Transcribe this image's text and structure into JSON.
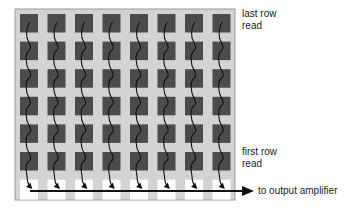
{
  "diagram": {
    "grid": {
      "columns": 8,
      "pixel_rows": 6,
      "readout_rows": 1,
      "colors": {
        "frame_fill": "#d3d3d3",
        "frame_border": "#9a9a9a",
        "pixel_fill": "#4b4b4b",
        "readout_fill": "#ffffff",
        "arrow": "#111111"
      }
    },
    "labels": {
      "last_row_line1": "last row",
      "last_row_line2": "read",
      "first_row_line1": "first row",
      "first_row_line2": "read",
      "output": "to output amplifier"
    }
  }
}
